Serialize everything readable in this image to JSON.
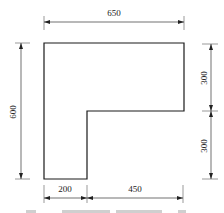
{
  "diagram": {
    "type": "L-shaped plan with dimension lines",
    "shape": {
      "outline_points": [
        [
          44,
          43
        ],
        [
          184,
          43
        ],
        [
          184,
          111
        ],
        [
          87,
          111
        ],
        [
          87,
          179
        ],
        [
          44,
          179
        ]
      ]
    },
    "dimensions": {
      "top": {
        "label": "650"
      },
      "left": {
        "label": "600"
      },
      "right_upper": {
        "label": "300"
      },
      "right_lower": {
        "label": "300"
      },
      "bottom_left": {
        "label": "200"
      },
      "bottom_right": {
        "label": "450"
      }
    },
    "caption": {
      "visible": "partially cut off, illegible"
    }
  }
}
